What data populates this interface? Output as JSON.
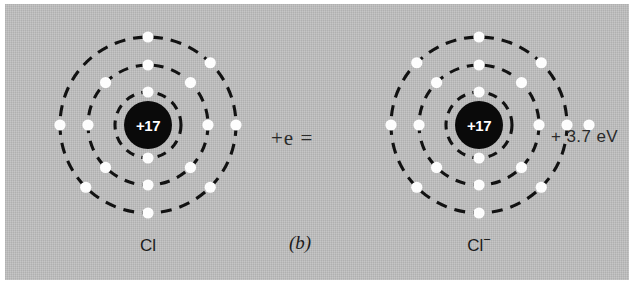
{
  "figure": {
    "caption": "(b)",
    "panel_color": "#b9b9b9",
    "page_color": "#ffffff"
  },
  "equation": {
    "added_electron_term": "+e =",
    "energy_released": "+ 3.7 eV"
  },
  "atoms": [
    {
      "id": "neutral-chlorine",
      "label": "Cl",
      "charge_superscript": "",
      "nucleus_charge": "+17",
      "nucleus_color": "#0a0a0a",
      "nucleus_text_color": "#ffffff",
      "shells": [
        {
          "name": "inner",
          "radius": 33,
          "electron_count": 2
        },
        {
          "name": "middle",
          "radius": 60,
          "electron_count": 8
        },
        {
          "name": "outer",
          "radius": 88,
          "electron_count": 7
        }
      ],
      "extra_electron": false
    },
    {
      "id": "chloride-ion",
      "label": "Cl",
      "charge_superscript": "−",
      "nucleus_charge": "+17",
      "nucleus_color": "#0a0a0a",
      "nucleus_text_color": "#ffffff",
      "shells": [
        {
          "name": "inner",
          "radius": 33,
          "electron_count": 2
        },
        {
          "name": "middle",
          "radius": 60,
          "electron_count": 8
        },
        {
          "name": "outer",
          "radius": 88,
          "electron_count": 8
        }
      ],
      "extra_electron": true
    }
  ],
  "colors": {
    "electron": "#fdfdfd",
    "shell_stroke": "#121212",
    "text": "#1b1b1b"
  }
}
